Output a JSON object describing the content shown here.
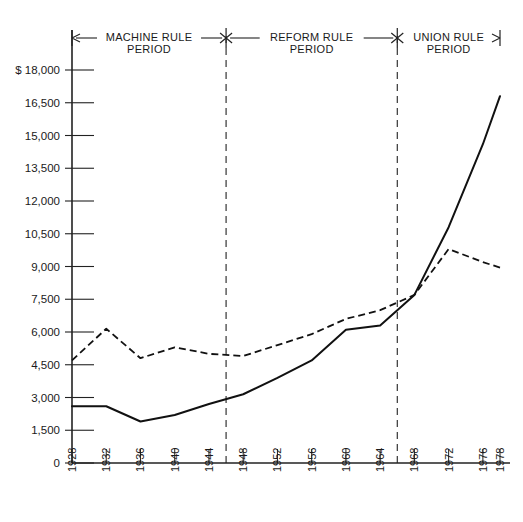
{
  "chart_data": {
    "type": "line",
    "title": "",
    "subtitle": "",
    "xlabel": "",
    "ylabel": "$",
    "currency_symbol": "$",
    "xlim": [
      1928,
      1978
    ],
    "ylim": [
      0,
      18000
    ],
    "grid": false,
    "legend_position": "none",
    "y_ticks": [
      0,
      1500,
      3000,
      4500,
      6000,
      7500,
      9000,
      10500,
      12000,
      13500,
      15000,
      16500,
      18000
    ],
    "y_tick_labels": [
      "0",
      "1,500",
      "3,000",
      "4,500",
      "6,000",
      "7,500",
      "9,000",
      "10,500",
      "12,000",
      "13,500",
      "15,000",
      "16,500",
      "$ 18,000"
    ],
    "x_ticks": [
      1928,
      1932,
      1936,
      1940,
      1944,
      1948,
      1952,
      1956,
      1960,
      1964,
      1968,
      1972,
      1976,
      1978
    ],
    "x_tick_labels": [
      "1928",
      "1932",
      "1936",
      "1940",
      "1944",
      "1948",
      "1952",
      "1956",
      "1960",
      "1964",
      "1968",
      "1972",
      "1976",
      "1978"
    ],
    "x": [
      1928,
      1932,
      1936,
      1940,
      1944,
      1948,
      1952,
      1956,
      1960,
      1964,
      1968,
      1972,
      1976,
      1978
    ],
    "series": [
      {
        "name": "solid-series",
        "style": "solid",
        "values": [
          2600,
          2600,
          1900,
          2200,
          2700,
          3150,
          3900,
          4700,
          6100,
          6300,
          7700,
          10800,
          14600,
          16800
        ]
      },
      {
        "name": "dashed-series",
        "style": "dashed",
        "values": [
          4700,
          6150,
          4800,
          5300,
          5000,
          4900,
          5400,
          5900,
          6600,
          7000,
          7700,
          9800,
          9200,
          8950
        ]
      }
    ],
    "annotations": [
      {
        "name": "machine-rule-period",
        "label_line1": "MACHINE RULE",
        "label_line2": "PERIOD",
        "start_year": 1928,
        "end_year": 1946
      },
      {
        "name": "reform-rule-period",
        "label_line1": "REFORM  RULE",
        "label_line2": "PERIOD",
        "start_year": 1946,
        "end_year": 1966
      },
      {
        "name": "union-rule-period",
        "label_line1": "UNION RULE",
        "label_line2": "PERIOD",
        "start_year": 1966,
        "end_year": 1978
      }
    ],
    "dividers": [
      {
        "name": "machine-reform-divider",
        "year": 1946
      },
      {
        "name": "reform-union-divider",
        "year": 1966
      }
    ]
  },
  "axis": {
    "y_axis_name": "y-axis",
    "x_axis_name": "x-axis"
  }
}
